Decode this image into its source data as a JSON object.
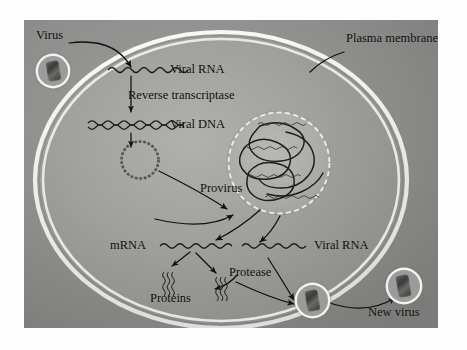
{
  "figure": {
    "background_color": "#ffffff",
    "panel_color": "#8e8e8e",
    "cell_color": "#9a9a9a",
    "membrane_color": "#f4f4ef",
    "nucleus_color": "#a6a6a4",
    "ink_color": "#0d0d0d"
  },
  "labels": {
    "virus": "Virus",
    "plasma_membrane": "Plasma membrane",
    "viral_rna_top": "Viral RNA",
    "reverse_transcriptase": "Reverse transcriptase",
    "viral_dna": "Viral DNA",
    "provirus": "Provirus",
    "mrna": "mRNA",
    "viral_rna_bottom": "Viral RNA",
    "proteins": "Proteins",
    "protease": "Protease",
    "new_virus": "New virus"
  },
  "icons": {
    "incoming_virion": "virus-particle-icon",
    "budding_virion": "virus-particle-icon",
    "released_virion": "virus-particle-icon",
    "rna_strand": "wavy-single-strand-icon",
    "dna_strand": "wavy-double-strand-icon",
    "circular_dna": "circular-dna-icon",
    "chromosome": "chromosome-loop-icon",
    "protein_cluster": "protein-squiggle-icon"
  },
  "structures": [
    {
      "name": "plasma-membrane",
      "kind": "ellipse"
    },
    {
      "name": "nucleus",
      "kind": "circle"
    },
    {
      "name": "provirus-chromosome",
      "kind": "wavy-loop"
    }
  ],
  "flow_steps": [
    "Virus enters cell",
    "Viral RNA released",
    "Reverse transcriptase makes Viral DNA",
    "Circular viral DNA enters nucleus",
    "Provirus integrates into chromosome",
    "Transcription yields mRNA and Viral RNA",
    "mRNA translated into Proteins",
    "Protease processes proteins for assembly",
    "New virus buds from plasma membrane"
  ]
}
